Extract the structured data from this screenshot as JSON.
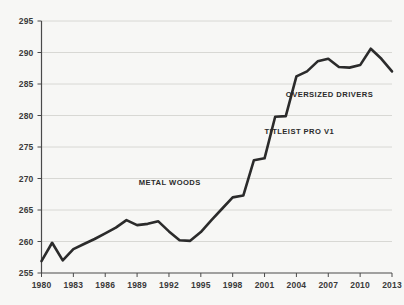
{
  "chart_data": {
    "type": "line",
    "title": "",
    "subtitle": "",
    "xlabel": "",
    "ylabel": "",
    "xlim": [
      1980,
      2013
    ],
    "ylim": [
      255,
      295
    ],
    "ytick_values": [
      255,
      260,
      265,
      270,
      275,
      280,
      285,
      290,
      295
    ],
    "ytick_labels": [
      "255",
      "260",
      "265",
      "270",
      "275",
      "280",
      "285",
      "290",
      "295"
    ],
    "xtick_values": [
      1980,
      1983,
      1986,
      1989,
      1992,
      1995,
      1998,
      2001,
      2004,
      2007,
      2010,
      2013
    ],
    "xtick_labels": [
      "1980",
      "1983",
      "1986",
      "1989",
      "1992",
      "1995",
      "1998",
      "2001",
      "2004",
      "2007",
      "2010",
      "2013"
    ],
    "grid": true,
    "grid_axis": "y",
    "legend": false,
    "legend_position": "none",
    "line_color": "#2b2b2b",
    "line_width": 2.6,
    "background_color": "#f7f7f5",
    "grid_color": "#d8d8d4",
    "axis_color": "#4a4a4a",
    "series": [
      {
        "name": "Average driving distance",
        "x": [
          1980,
          1981,
          1982,
          1983,
          1984,
          1985,
          1986,
          1987,
          1988,
          1989,
          1990,
          1991,
          1992,
          1993,
          1994,
          1995,
          1996,
          1997,
          1998,
          1999,
          2000,
          2001,
          2002,
          2003,
          2004,
          2005,
          2006,
          2007,
          2008,
          2009,
          2010,
          2011,
          2012,
          2013
        ],
        "values": [
          256.9,
          259.8,
          257.0,
          258.8,
          259.6,
          260.4,
          261.3,
          262.2,
          263.4,
          262.6,
          262.8,
          263.2,
          261.6,
          260.2,
          260.1,
          261.5,
          263.4,
          265.2,
          267.0,
          267.3,
          272.9,
          273.2,
          279.8,
          279.9,
          286.2,
          287.0,
          288.6,
          289.0,
          287.7,
          287.6,
          288.0,
          290.6,
          289.0,
          287.0
        ]
      }
    ],
    "annotations": [
      {
        "label": "METAL WOODS",
        "x_anchor": 1995,
        "y_anchor": 269.0,
        "align": "end"
      },
      {
        "label": "TITLEIST PRO V1",
        "x_anchor": 2001,
        "y_anchor": 277.1,
        "align": "start"
      },
      {
        "label": "OVERSIZED DRIVERS",
        "x_anchor": 2003,
        "y_anchor": 283.0,
        "align": "start"
      }
    ]
  }
}
